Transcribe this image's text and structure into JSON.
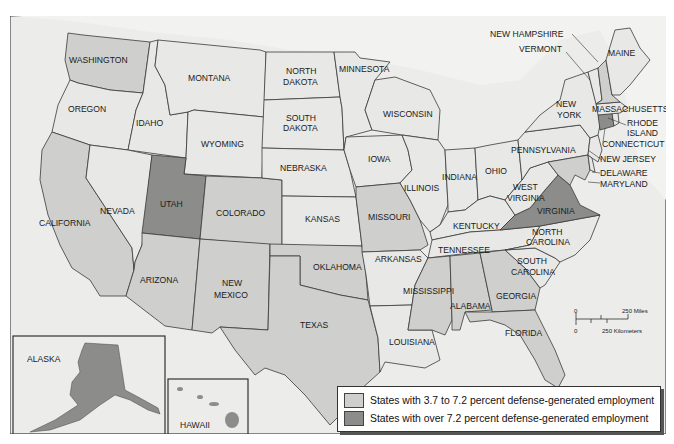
{
  "colors": {
    "background_water": "#ececea",
    "state_default": "#e8e8e6",
    "state_mid": "#cfcfcd",
    "state_high": "#8c8c8a",
    "border": "#3a3a3a"
  },
  "legend": {
    "items": [
      {
        "label": "States with 3.7 to 7.2 percent defense-generated employment",
        "category": "mid"
      },
      {
        "label": "States with over 7.2 percent defense-generated employment",
        "category": "high"
      }
    ]
  },
  "scale_bar": {
    "zero_top": "0",
    "miles_label": "250 Miles",
    "zero_bottom": "0",
    "km_label": "250 Kilometers"
  },
  "insets": {
    "alaska": {
      "label": "ALASKA",
      "category": "high"
    },
    "hawaii": {
      "label": "HAWAII",
      "category": "high"
    }
  },
  "states": {
    "washington": {
      "label": "WASHINGTON",
      "category": "mid"
    },
    "oregon": {
      "label": "OREGON",
      "category": "default"
    },
    "california": {
      "label": "CALIFORNIA",
      "category": "mid"
    },
    "idaho": {
      "label": "IDAHO",
      "category": "default"
    },
    "nevada": {
      "label": "NEVADA",
      "category": "default"
    },
    "montana": {
      "label": "MONTANA",
      "category": "default"
    },
    "wyoming": {
      "label": "WYOMING",
      "category": "default"
    },
    "utah": {
      "label": "UTAH",
      "category": "high"
    },
    "colorado": {
      "label": "COLORADO",
      "category": "mid"
    },
    "arizona": {
      "label": "ARIZONA",
      "category": "mid"
    },
    "new_mexico": {
      "label_1": "NEW",
      "label_2": "MEXICO",
      "category": "mid"
    },
    "north_dakota": {
      "label_1": "NORTH",
      "label_2": "DAKOTA",
      "category": "default"
    },
    "south_dakota": {
      "label_1": "SOUTH",
      "label_2": "DAKOTA",
      "category": "default"
    },
    "nebraska": {
      "label": "NEBRASKA",
      "category": "default"
    },
    "kansas": {
      "label": "KANSAS",
      "category": "default"
    },
    "oklahoma": {
      "label": "OKLAHOMA",
      "category": "mid"
    },
    "texas": {
      "label": "TEXAS",
      "category": "mid"
    },
    "minnesota": {
      "label": "MINNESOTA",
      "category": "default"
    },
    "iowa": {
      "label": "IOWA",
      "category": "default"
    },
    "missouri": {
      "label": "MISSOURI",
      "category": "mid"
    },
    "arkansas": {
      "label": "ARKANSAS",
      "category": "default"
    },
    "louisiana": {
      "label": "LOUISIANA",
      "category": "default"
    },
    "wisconsin": {
      "label": "WISCONSIN",
      "category": "default"
    },
    "illinois": {
      "label": "ILLINOIS",
      "category": "default"
    },
    "mississippi": {
      "label": "MISSISSIPPI",
      "category": "mid"
    },
    "indiana": {
      "label": "INDIANA",
      "category": "default"
    },
    "kentucky": {
      "label": "KENTUCKY",
      "category": "default"
    },
    "tennessee": {
      "label": "TENNESSEE",
      "category": "default"
    },
    "alabama": {
      "label": "ALABAMA",
      "category": "mid"
    },
    "ohio": {
      "label": "OHIO",
      "category": "default"
    },
    "georgia": {
      "label": "GEORGIA",
      "category": "mid"
    },
    "florida": {
      "label": "FLORIDA",
      "category": "mid"
    },
    "south_carolina": {
      "label_1": "SOUTH",
      "label_2": "CAROLINA",
      "category": "default"
    },
    "north_carolina": {
      "label_1": "NORTH",
      "label_2": "CAROLINA",
      "category": "default"
    },
    "virginia": {
      "label": "VIRGINIA",
      "category": "high"
    },
    "west_virginia": {
      "label_1": "WEST",
      "label_2": "VIRGINIA",
      "category": "default"
    },
    "pennsylvania": {
      "label": "PENNSYLVANIA",
      "category": "default"
    },
    "new_york": {
      "label_1": "NEW",
      "label_2": "YORK",
      "category": "default"
    },
    "new_jersey": {
      "label": "NEW JERSEY",
      "category": "default"
    },
    "delaware": {
      "label": "DELAWARE",
      "category": "default"
    },
    "maryland": {
      "label": "MARYLAND",
      "category": "mid"
    },
    "connecticut": {
      "label": "CONNECTICUT",
      "category": "high"
    },
    "rhode_island": {
      "label_1": "RHODE",
      "label_2": "ISLAND",
      "category": "default"
    },
    "massachusetts": {
      "label": "MASSACHUSETTS",
      "category": "default"
    },
    "vermont": {
      "label": "VERMONT",
      "category": "default"
    },
    "new_hampshire": {
      "label": "NEW HAMPSHIRE",
      "category": "mid"
    },
    "maine": {
      "label": "MAINE",
      "category": "default"
    }
  }
}
